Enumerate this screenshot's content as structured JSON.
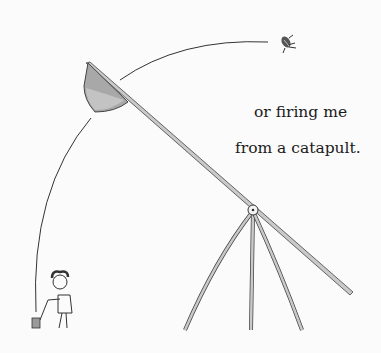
{
  "caption": {
    "line1": "or firing me",
    "line2": "from a catapult."
  },
  "illustration": {
    "elements": [
      "catapult",
      "bucket",
      "flying-bug",
      "trajectory-arc",
      "child-figure",
      "tripod-stand"
    ],
    "colors": {
      "background": "#fbfbfb",
      "ink": "#3a3a3a",
      "wood": "#c9c9c9",
      "bucket_fill": "#a8a8a8"
    }
  }
}
